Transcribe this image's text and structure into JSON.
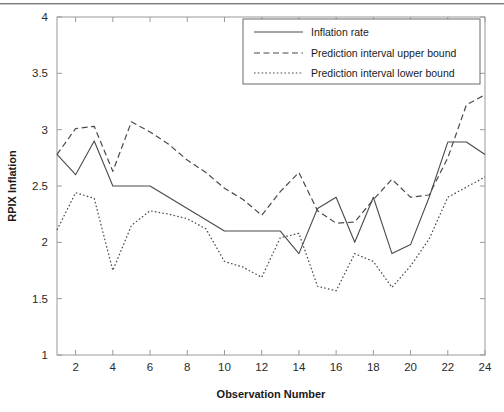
{
  "figure": {
    "background_color": "#ffffff",
    "axis_color": "#9a9a9a",
    "line_color": "#4a4a4a",
    "text_color": "#1a1a1a"
  },
  "chart_data": {
    "type": "line",
    "title": "",
    "xlabel": "Observation Number",
    "ylabel": "RPIX Inflation",
    "xlim": [
      1,
      24
    ],
    "ylim": [
      1,
      4
    ],
    "xticks": [
      2,
      4,
      6,
      8,
      10,
      12,
      14,
      16,
      18,
      20,
      22,
      24
    ],
    "xtick_labels": [
      "2",
      "4",
      "6",
      "8",
      "10",
      "12",
      "14",
      "16",
      "18",
      "20",
      "22",
      "24"
    ],
    "yticks": [
      1,
      1.5,
      2,
      2.5,
      3,
      3.5,
      4
    ],
    "ytick_labels": [
      "1",
      "1.5",
      "2",
      "2.5",
      "3",
      "3.5",
      "4"
    ],
    "grid": false,
    "legend_position": "upper right",
    "x": [
      1,
      2,
      3,
      4,
      5,
      6,
      7,
      8,
      9,
      10,
      11,
      12,
      13,
      14,
      15,
      16,
      17,
      18,
      19,
      20,
      21,
      22,
      23,
      24
    ],
    "series": [
      {
        "name": "Inflation rate",
        "style": "solid",
        "values": [
          2.78,
          2.6,
          2.9,
          2.5,
          2.5,
          2.5,
          2.4,
          2.3,
          2.2,
          2.1,
          2.1,
          2.1,
          2.1,
          1.9,
          2.3,
          2.4,
          2.0,
          2.4,
          1.9,
          1.98,
          2.4,
          2.89,
          2.89,
          2.78
        ]
      },
      {
        "name": "Prediction interval upper bound",
        "style": "dashed",
        "values": [
          2.78,
          3.01,
          3.03,
          2.63,
          3.07,
          2.98,
          2.87,
          2.73,
          2.62,
          2.48,
          2.38,
          2.24,
          2.45,
          2.62,
          2.28,
          2.17,
          2.18,
          2.38,
          2.56,
          2.4,
          2.42,
          2.75,
          3.22,
          3.31
        ]
      },
      {
        "name": "Prediction interval lower bound",
        "style": "dotted",
        "values": [
          2.11,
          2.44,
          2.39,
          1.75,
          2.15,
          2.28,
          2.25,
          2.21,
          2.12,
          1.83,
          1.78,
          1.69,
          2.04,
          2.08,
          1.61,
          1.57,
          1.9,
          1.83,
          1.6,
          1.79,
          2.03,
          2.4,
          2.49,
          2.58
        ]
      }
    ]
  },
  "legend": {
    "entries": [
      {
        "label": "Inflation rate",
        "style": "solid"
      },
      {
        "label": "Prediction interval upper bound",
        "style": "dashed"
      },
      {
        "label": "Prediction interval lower bound",
        "style": "dotted"
      }
    ]
  }
}
